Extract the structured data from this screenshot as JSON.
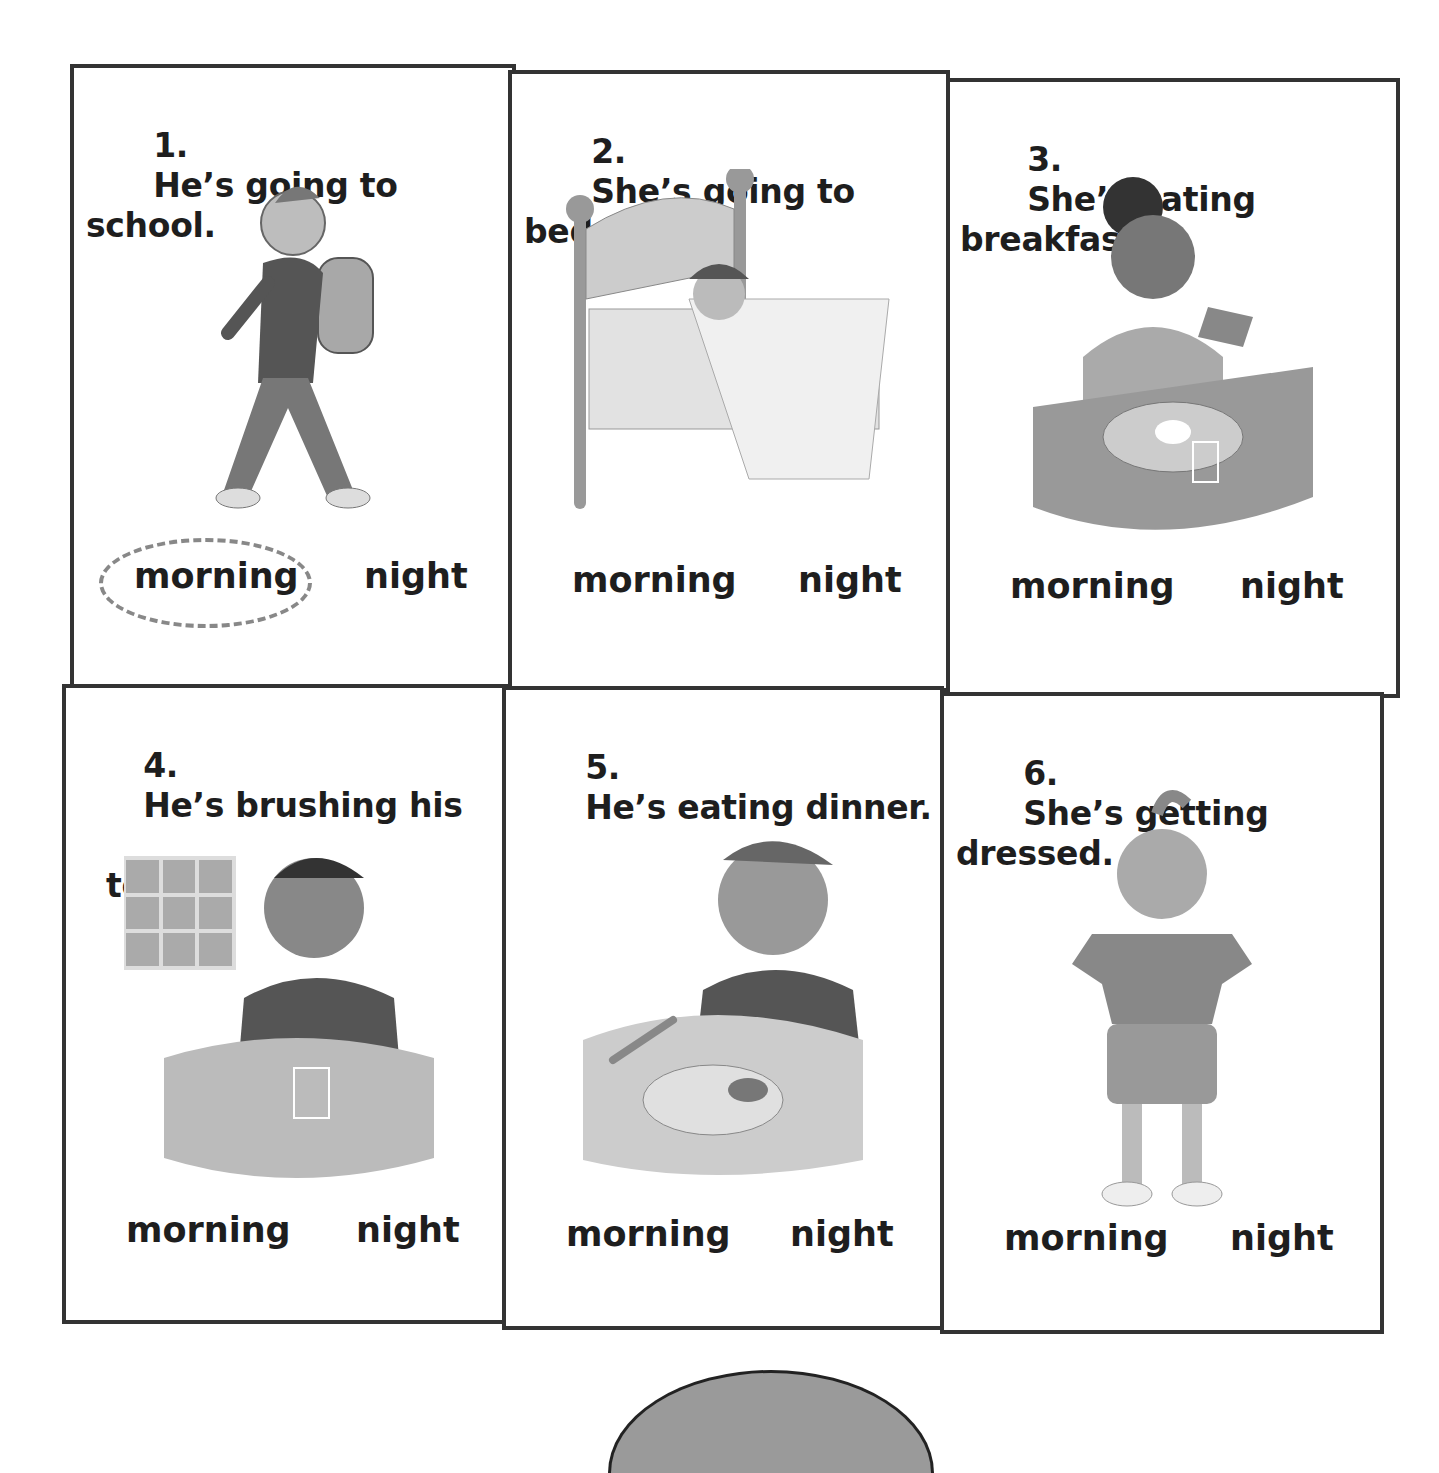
{
  "worksheet": {
    "cards": [
      {
        "number": "1.",
        "sentence": "He’s going to school.",
        "sentence_line2": "",
        "picture": "boy-walking-with-backpack",
        "options": [
          "morning",
          "night"
        ],
        "selected": "morning"
      },
      {
        "number": "2.",
        "sentence": "She’s going to bed.",
        "sentence_line2": "",
        "picture": "girl-sleeping-in-bed",
        "options": [
          "morning",
          "night"
        ],
        "selected": ""
      },
      {
        "number": "3.",
        "sentence": "She’s eating breakfast.",
        "sentence_line2": "",
        "picture": "girl-eating-toast",
        "options": [
          "morning",
          "night"
        ],
        "selected": ""
      },
      {
        "number": "4.",
        "sentence": "He’s brushing his",
        "sentence_line2": "teeth.",
        "picture": "boy-brushing-teeth",
        "options": [
          "morning",
          "night"
        ],
        "selected": ""
      },
      {
        "number": "5.",
        "sentence": "He’s eating dinner.",
        "sentence_line2": "",
        "picture": "boy-eating-dinner",
        "options": [
          "morning",
          "night"
        ],
        "selected": ""
      },
      {
        "number": "6.",
        "sentence": "She’s getting dressed.",
        "sentence_line2": "",
        "picture": "girl-getting-dressed",
        "options": [
          "morning",
          "night"
        ],
        "selected": ""
      }
    ]
  },
  "colors": {
    "border": "#333333",
    "circle": "#888888",
    "text": "#1e1e1e"
  }
}
